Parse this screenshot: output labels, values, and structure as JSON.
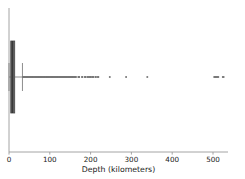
{
  "chart_data": {
    "type": "boxplot",
    "orientation": "horizontal",
    "title": "",
    "xlabel": "Depth (kilometers)",
    "ylabel": "",
    "xlim": [
      -20,
      560
    ],
    "xticks": [
      0,
      100,
      200,
      300,
      400,
      500
    ],
    "xtick_labels": [
      "0",
      "100",
      "200",
      "300",
      "400",
      "500"
    ],
    "grid": false,
    "legend": null,
    "boxes": [
      {
        "name": "depth",
        "q1": 4.3,
        "median": 8.0,
        "q3": 14.0,
        "whisker_low": 0.0,
        "whisker_high": 33.0,
        "box_fill": "#5a5a5a",
        "box_edge": "#4a4a4a",
        "median_color": "#2a2a2a",
        "whisker_color": "#7a7a7a",
        "flier_color": "#777777",
        "fliers": [
          34,
          35,
          36,
          37,
          38,
          39,
          40,
          41,
          42,
          43,
          44,
          45,
          46,
          47,
          48,
          49,
          50,
          51,
          52,
          53,
          54,
          55,
          56,
          57,
          58,
          59,
          60,
          61,
          62,
          63,
          64,
          65,
          66,
          67,
          68,
          69,
          70,
          71,
          72,
          73,
          74,
          75,
          76,
          77,
          78,
          79,
          80,
          81,
          82,
          83,
          84,
          85,
          86,
          87,
          88,
          89,
          90,
          91,
          92,
          93,
          94,
          95,
          96,
          97,
          98,
          99,
          100,
          101,
          102,
          103,
          104,
          105,
          106,
          107,
          108,
          109,
          110,
          111,
          112,
          113,
          114,
          115,
          116,
          117,
          118,
          119,
          120,
          121,
          122,
          123,
          124,
          125,
          126,
          127,
          128,
          129,
          130,
          131,
          132,
          133,
          134,
          135,
          136,
          137,
          138,
          139,
          140,
          141,
          142,
          143,
          144,
          145,
          146,
          147,
          148,
          149,
          150,
          151,
          152,
          153,
          154,
          155,
          156,
          157,
          158,
          159,
          160,
          161,
          162,
          163,
          164,
          170,
          171,
          172,
          179,
          180,
          186,
          187,
          188,
          193,
          194,
          198,
          199,
          200,
          201,
          205,
          206,
          207,
          212,
          213,
          218,
          219,
          247,
          287,
          339,
          503,
          505,
          507,
          509,
          511,
          513,
          524,
          526
        ]
      }
    ]
  },
  "axes": {
    "x_axis_label": "Depth (kilometers)",
    "tick_labels": [
      "0",
      "100",
      "200",
      "300",
      "400",
      "500"
    ]
  }
}
